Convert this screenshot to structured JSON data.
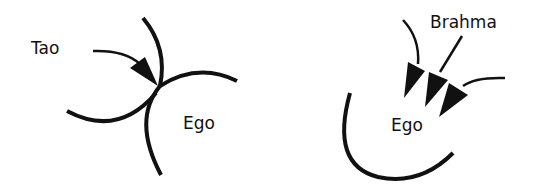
{
  "diagram": {
    "left": {
      "labels": {
        "tao": "Tao",
        "ego": "Ego"
      }
    },
    "right": {
      "labels": {
        "brahma": "Brahma",
        "ego": "Ego"
      }
    },
    "colors": {
      "stroke": "#111111",
      "background": "#ffffff"
    }
  }
}
